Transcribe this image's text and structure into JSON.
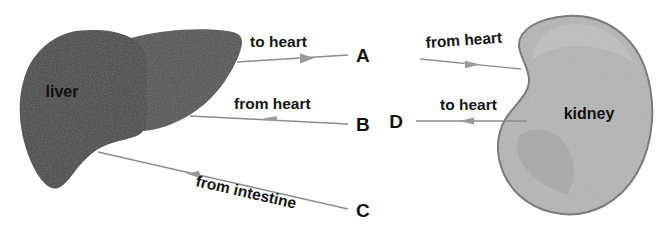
{
  "figure": {
    "background_color": "#ffffff"
  },
  "organs": [
    {
      "id": "liver",
      "label": "liver",
      "fill_color": "#4a4a4a",
      "lobe_fill_color": "#505050",
      "label_color": "#111111"
    },
    {
      "id": "kidney",
      "label": "kidney",
      "fill_color": "#b4b4b4",
      "outline_color": "#6f6f6f",
      "label_color": "#111111"
    }
  ],
  "vessels": [
    {
      "id": "liver-to-heart",
      "organ": "liver",
      "text": "to heart",
      "letter": "A",
      "direction": "away-from-organ",
      "arrow_color": "#8d8d8d"
    },
    {
      "id": "liver-from-heart",
      "organ": "liver",
      "text": "from heart",
      "letter": "B",
      "direction": "toward-organ",
      "arrow_color": "#8d8d8d"
    },
    {
      "id": "liver-from-intestine",
      "organ": "liver",
      "text": "from intestine",
      "letter": "C",
      "direction": "toward-organ",
      "arrow_color": "#8d8d8d"
    },
    {
      "id": "kidney-from-heart",
      "organ": "kidney",
      "text": "from heart",
      "letter": "",
      "direction": "toward-organ",
      "arrow_color": "#8d8d8d"
    },
    {
      "id": "kidney-to-heart",
      "organ": "kidney",
      "text": "to heart",
      "letter": "D",
      "direction": "away-from-organ",
      "arrow_color": "#8d8d8d"
    }
  ],
  "labels": {
    "liver_name": "liver",
    "kidney_name": "kidney",
    "to_heart": "to heart",
    "from_heart": "from heart",
    "from_intestine": "from intestine",
    "letter_a": "A",
    "letter_b": "B",
    "letter_c": "C",
    "letter_d": "D"
  }
}
